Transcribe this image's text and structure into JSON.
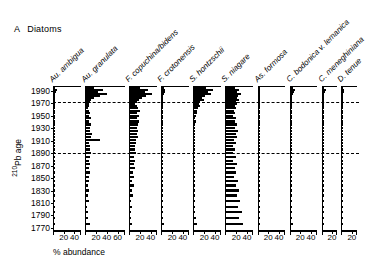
{
  "figure": {
    "panel_letter": "A",
    "panel_title": "Diatoms"
  },
  "axes": {
    "y_title_main": "Pb age",
    "y_title_superscript": "210",
    "y_title_display": "210Pb age",
    "x_title": "% abundance"
  },
  "chart_data": {
    "type": "bar",
    "subtitle": "",
    "orientation": "horizontal-stratigraphic",
    "xlabel": "% abundance",
    "ylabel": "210Pb age",
    "grid": false,
    "legend": "none",
    "ylim": [
      1765,
      1998
    ],
    "y_axis_inverted": true,
    "y_tick_labels": [
      "1990",
      "1970",
      "1950",
      "1930",
      "1910",
      "1890",
      "1870",
      "1850",
      "1830",
      "1810",
      "1790",
      "1770"
    ],
    "y_tick_values": [
      1990,
      1970,
      1950,
      1930,
      1910,
      1890,
      1870,
      1850,
      1830,
      1810,
      1790,
      1770
    ],
    "marker_horizons": [
      1973,
      1890
    ],
    "marker_horizon_style": "dashed",
    "categories": [
      1994,
      1991,
      1988,
      1985,
      1982,
      1979,
      1976,
      1973,
      1970,
      1966,
      1962,
      1958,
      1954,
      1950,
      1946,
      1941,
      1936,
      1931,
      1926,
      1921,
      1916,
      1911,
      1906,
      1901,
      1896,
      1890,
      1884,
      1878,
      1872,
      1866,
      1859,
      1852,
      1845,
      1838,
      1830,
      1822,
      1813,
      1804,
      1795,
      1786,
      1776
    ],
    "series": [
      {
        "name": "Au. ambigua",
        "xlim": [
          0,
          50
        ],
        "x_tick_values": [
          20,
          40
        ],
        "x_tick_labels": [
          "20",
          "40"
        ],
        "values": [
          2,
          5,
          3,
          2,
          1,
          1,
          1,
          1,
          0,
          0,
          0,
          0,
          1,
          0,
          0,
          1,
          0,
          0,
          1,
          0,
          1,
          1,
          0,
          0,
          1,
          1,
          0,
          1,
          0,
          1,
          0,
          1,
          1,
          0,
          1,
          0,
          1,
          0,
          1,
          0,
          2
        ]
      },
      {
        "name": "Au. granulata",
        "xlim": [
          0,
          72
        ],
        "x_tick_values": [
          20,
          40,
          60
        ],
        "x_tick_labels": [
          "20",
          "40",
          "60"
        ],
        "values": [
          14,
          31,
          22,
          38,
          25,
          15,
          9,
          7,
          5,
          6,
          4,
          5,
          7,
          6,
          9,
          6,
          10,
          8,
          7,
          11,
          9,
          25,
          6,
          8,
          7,
          9,
          7,
          6,
          8,
          5,
          7,
          5,
          6,
          4,
          6,
          3,
          5,
          2,
          4,
          3,
          7
        ]
      },
      {
        "name": "F. copuchina/bidens",
        "xlim": [
          0,
          50
        ],
        "x_tick_values": [
          20,
          40
        ],
        "x_tick_labels": [
          "20",
          "40"
        ],
        "values": [
          18,
          32,
          27,
          41,
          30,
          22,
          17,
          13,
          9,
          12,
          15,
          18,
          13,
          16,
          12,
          17,
          14,
          13,
          15,
          12,
          14,
          10,
          11,
          9,
          8,
          10,
          7,
          9,
          6,
          8,
          5,
          7,
          4,
          6,
          3,
          5,
          2,
          3,
          1,
          2,
          4
        ]
      },
      {
        "name": "F. crotonensis",
        "xlim": [
          0,
          50
        ],
        "x_tick_values": [
          20,
          40
        ],
        "x_tick_labels": [
          "20",
          "40"
        ],
        "values": [
          3,
          5,
          4,
          3,
          2,
          2,
          1,
          1,
          1,
          1,
          0,
          1,
          0,
          1,
          0,
          1,
          0,
          0,
          1,
          0,
          1,
          0,
          0,
          1,
          0,
          1,
          0,
          1,
          0,
          0,
          1,
          0,
          1,
          0,
          1,
          0,
          1,
          0,
          1,
          0,
          3
        ]
      },
      {
        "name": "S. hontzschii",
        "xlim": [
          0,
          50
        ],
        "x_tick_values": [
          20,
          40
        ],
        "x_tick_labels": [
          "20",
          "40"
        ],
        "values": [
          22,
          34,
          26,
          30,
          20,
          14,
          18,
          11,
          8,
          10,
          6,
          5,
          4,
          3,
          2,
          3,
          2,
          1,
          2,
          1,
          1,
          1,
          0,
          1,
          0,
          1,
          0,
          1,
          0,
          1,
          0,
          1,
          0,
          1,
          1,
          2,
          1,
          2,
          1,
          3,
          4
        ]
      },
      {
        "name": "S. niagare",
        "xlim": [
          0,
          50
        ],
        "x_tick_values": [
          20,
          40
        ],
        "x_tick_labels": [
          "20",
          "40"
        ],
        "values": [
          16,
          24,
          20,
          27,
          22,
          19,
          23,
          17,
          20,
          15,
          18,
          14,
          16,
          13,
          18,
          15,
          20,
          16,
          22,
          17,
          19,
          14,
          18,
          13,
          16,
          12,
          17,
          13,
          20,
          15,
          18,
          14,
          22,
          17,
          24,
          19,
          26,
          21,
          28,
          24,
          30
        ]
      },
      {
        "name": "As. formosa",
        "xlim": [
          0,
          50
        ],
        "x_tick_values": [
          20,
          40
        ],
        "x_tick_labels": [
          "20",
          "40"
        ],
        "values": [
          2,
          3,
          2,
          1,
          1,
          1,
          0,
          1,
          0,
          0,
          1,
          0,
          0,
          1,
          3,
          2,
          1,
          0,
          1,
          0,
          1,
          2,
          0,
          1,
          0,
          1,
          0,
          0,
          1,
          0,
          1,
          0,
          0,
          1,
          0,
          1,
          0,
          1,
          0,
          1,
          2
        ]
      },
      {
        "name": "C. bodonica v. lemanica",
        "xlim": [
          0,
          50
        ],
        "x_tick_values": [
          20,
          40
        ],
        "x_tick_labels": [
          "20",
          "40"
        ],
        "values": [
          4,
          9,
          6,
          4,
          3,
          2,
          2,
          1,
          1,
          2,
          1,
          1,
          2,
          1,
          2,
          1,
          2,
          1,
          2,
          1,
          2,
          1,
          1,
          2,
          1,
          2,
          1,
          2,
          1,
          2,
          1,
          2,
          1,
          2,
          1,
          2,
          1,
          2,
          1,
          2,
          4
        ]
      },
      {
        "name": "C. meneghiniana",
        "xlim": [
          0,
          28
        ],
        "x_tick_values": [
          20
        ],
        "x_tick_labels": [
          "20"
        ],
        "values": [
          3,
          6,
          4,
          3,
          2,
          2,
          1,
          1,
          1,
          1,
          0,
          1,
          0,
          1,
          0,
          1,
          0,
          1,
          0,
          1,
          0,
          1,
          0,
          0,
          1,
          0,
          1,
          0,
          1,
          0,
          1,
          0,
          1,
          0,
          1,
          0,
          1,
          0,
          1,
          0,
          2
        ]
      },
      {
        "name": "D. tenue",
        "xlim": [
          0,
          28
        ],
        "x_tick_values": [
          20
        ],
        "x_tick_labels": [
          "20"
        ],
        "values": [
          2,
          4,
          3,
          2,
          1,
          1,
          1,
          0,
          1,
          0,
          1,
          0,
          1,
          0,
          1,
          0,
          0,
          1,
          0,
          1,
          0,
          1,
          0,
          1,
          0,
          1,
          0,
          1,
          0,
          1,
          0,
          1,
          0,
          1,
          0,
          1,
          0,
          1,
          0,
          1,
          2
        ]
      }
    ]
  }
}
